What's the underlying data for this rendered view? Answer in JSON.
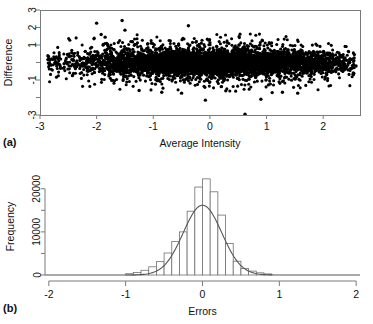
{
  "figure": {
    "background": "#ffffff",
    "foreground": "#111111",
    "point_color": "#000000",
    "line_color": "#555555"
  },
  "panels": [
    {
      "tag": "(a)",
      "type": "scatter"
    },
    {
      "tag": "(b)",
      "type": "histogram"
    }
  ],
  "chart_data": [
    {
      "type": "scatter",
      "panel": "(a)",
      "title": "",
      "xlabel": "Average Intensity",
      "ylabel": "Difference",
      "xlim": [
        -3,
        2.65
      ],
      "ylim": [
        -3,
        3
      ],
      "xticks": [
        -3,
        -2,
        -1,
        0,
        1,
        2
      ],
      "xticklabels": [
        "-3",
        "-2",
        "-1",
        "0",
        "1",
        "2"
      ],
      "yticks": [
        -3,
        -2,
        -1,
        0,
        1,
        2,
        3
      ],
      "yticklabels": [
        "-3",
        "",
        "-1",
        "",
        "1",
        "2",
        "3"
      ],
      "grid": false,
      "legend": "none",
      "box": true,
      "marker": "filled-circle",
      "description": "Bland-Altman style MA plot: dense horizontal cloud of points centred on Difference = 0, spanning Average Intensity about -2.85 to 2.6, with the bulk of the mass between Difference -0.8 and +0.9 and scattered outliers reaching +2.4 and -2.9.",
      "n_points_approx": 6000,
      "cloud": {
        "x_center": 0.1,
        "x_spread": 1.25,
        "y_center": 0.0,
        "y_core_sd": 0.38,
        "outlier_fraction": 0.02
      },
      "outliers": [
        {
          "x": -2.0,
          "y": 2.25
        },
        {
          "x": -1.55,
          "y": 2.4
        },
        {
          "x": -1.5,
          "y": 1.85
        },
        {
          "x": -0.38,
          "y": 2.1
        },
        {
          "x": -1.92,
          "y": 1.6
        },
        {
          "x": -1.85,
          "y": 1.45
        },
        {
          "x": -1.25,
          "y": -1.6
        },
        {
          "x": -0.85,
          "y": -1.7
        },
        {
          "x": -0.5,
          "y": -1.75
        },
        {
          "x": -0.08,
          "y": -2.15
        },
        {
          "x": 0.28,
          "y": -1.62
        },
        {
          "x": 0.62,
          "y": -2.95
        },
        {
          "x": 0.9,
          "y": -2.1
        },
        {
          "x": 1.1,
          "y": -1.72
        },
        {
          "x": 1.28,
          "y": -1.7
        },
        {
          "x": 1.55,
          "y": -1.75
        },
        {
          "x": -2.85,
          "y": 0.35
        },
        {
          "x": -2.82,
          "y": -0.1
        },
        {
          "x": 2.55,
          "y": 0.45
        },
        {
          "x": 2.58,
          "y": -0.2
        }
      ]
    },
    {
      "type": "bar",
      "panel": "(b)",
      "title": "",
      "xlabel": "Errors",
      "ylabel": "Frequency",
      "xlim": [
        -2.05,
        2.05
      ],
      "ylim": [
        0,
        22500
      ],
      "xticks": [
        -2,
        -1,
        0,
        1,
        2
      ],
      "xticklabels": [
        "-2",
        "-1",
        "0",
        "1",
        "2"
      ],
      "yticks": [
        0,
        5000,
        10000,
        15000,
        20000
      ],
      "yticklabels": [
        "0",
        "",
        "10000",
        "",
        "20000"
      ],
      "grid": false,
      "legend": "none",
      "bin_width": 0.1,
      "categories": [
        "-0.95",
        "-0.85",
        "-0.75",
        "-0.65",
        "-0.55",
        "-0.45",
        "-0.35",
        "-0.25",
        "-0.15",
        "-0.05",
        "0.05",
        "0.15",
        "0.25",
        "0.35",
        "0.45",
        "0.55",
        "0.65",
        "0.75",
        "0.85"
      ],
      "bin_edges": [
        -1.0,
        -0.9,
        -0.8,
        -0.7,
        -0.6,
        -0.5,
        -0.4,
        -0.3,
        -0.2,
        -0.1,
        0.0,
        0.1,
        0.2,
        0.3,
        0.4,
        0.5,
        0.6,
        0.7,
        0.8,
        0.9
      ],
      "values": [
        300,
        600,
        1100,
        1900,
        3100,
        5100,
        7800,
        10000,
        14800,
        20400,
        22300,
        19300,
        13900,
        7300,
        3200,
        1500,
        900,
        500,
        250
      ],
      "overlay_curve": {
        "name": "normal density fit",
        "type": "line",
        "mean": 0.0,
        "sd": 0.25,
        "peak_value": 16200,
        "color": "#555555"
      }
    }
  ]
}
